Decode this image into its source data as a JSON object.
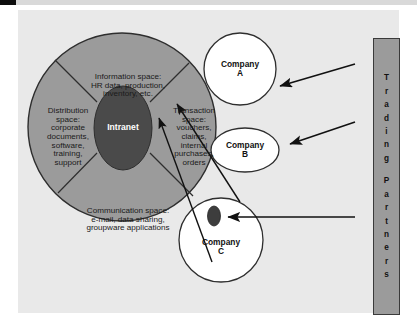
{
  "diagram": {
    "type": "venn-sector-diagram",
    "title_text_absent": true,
    "center": {
      "label": "Intranet",
      "shape": "ellipse",
      "fill": "#4a4a4a",
      "text_color": "#ffffff"
    },
    "outer_circle": {
      "fill": "#9b9b9b",
      "stroke": "#2e2e2e"
    },
    "sectors": [
      {
        "name": "information-space",
        "text": "Information space:\nHR data, production,\ninventory, etc."
      },
      {
        "name": "distribution-space",
        "text": "Distribution\nspace:\ncorporate\ndocuments,\nsoftware,\ntraining,\nsupport"
      },
      {
        "name": "transaction-space",
        "text": "Transaction\nspace:\nvouchers,\nclaims,\ninternal\npurchases,\norders"
      },
      {
        "name": "communication-space",
        "text": "Communication space:\ne-mail, data sharing,\ngroupware applications"
      }
    ],
    "companies": [
      {
        "name": "company-a",
        "line1": "Company",
        "line2": "A",
        "shape": "circle",
        "fill": "#ffffff"
      },
      {
        "name": "company-b",
        "line1": "Company",
        "line2": "B",
        "shape": "ellipse",
        "fill": "#ffffff"
      },
      {
        "name": "company-c",
        "line1": "Company",
        "line2": "C",
        "shape": "circle",
        "fill": "#ffffff",
        "inner_dot_fill": "#3d3d3d"
      }
    ],
    "trading_partners": {
      "word1": "Trading",
      "word2": "Partners",
      "full_label": "Trading Partners",
      "bar_fill": "#9b9b9b",
      "bar_stroke": "#3a3a3a"
    },
    "arrows": [
      {
        "name": "arrow-partners-to-company-a"
      },
      {
        "name": "arrow-partners-to-company-b"
      },
      {
        "name": "arrow-partners-to-company-c-dot"
      },
      {
        "name": "arrow-company-c-to-information-space-1"
      },
      {
        "name": "arrow-company-c-to-information-space-2"
      }
    ],
    "colors": {
      "page_background": "#ffffff",
      "panel_background": "#e9e9e9",
      "gray_fill": "#9b9b9b",
      "dark_fill": "#4a4a4a",
      "line": "#1a1a1a"
    }
  }
}
